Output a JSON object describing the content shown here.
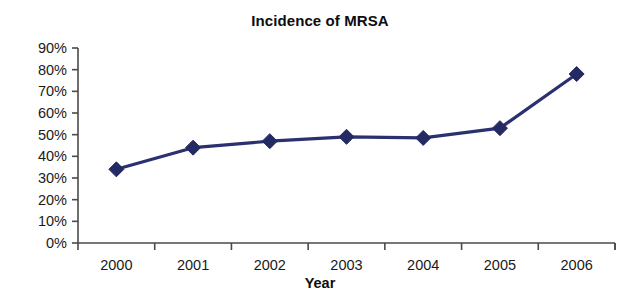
{
  "chart_data": {
    "type": "line",
    "title": "Incidence of MRSA",
    "xlabel": "Year",
    "ylabel": "",
    "categories": [
      "2000",
      "2001",
      "2002",
      "2003",
      "2004",
      "2005",
      "2006"
    ],
    "values": [
      34,
      44,
      47,
      49,
      48.5,
      53,
      78
    ],
    "ylim": [
      0,
      90
    ],
    "yticks": [
      "0%",
      "10%",
      "20%",
      "30%",
      "40%",
      "50%",
      "60%",
      "70%",
      "80%",
      "90%"
    ],
    "ytick_values": [
      0,
      10,
      20,
      30,
      40,
      50,
      60,
      70,
      80,
      90
    ],
    "ytick_suffix": "%",
    "grid": false,
    "legend": "none",
    "series": [
      {
        "name": "Incidence of MRSA",
        "values": [
          34,
          44,
          47,
          49,
          48.5,
          53,
          78
        ],
        "color": "#2a3070",
        "marker": "diamond"
      }
    ],
    "colors": {
      "line": "#2a3070",
      "marker": "#242a63",
      "axis": "#4a4a4a",
      "text": "#1a1a1a",
      "background": "#ffffff"
    }
  }
}
